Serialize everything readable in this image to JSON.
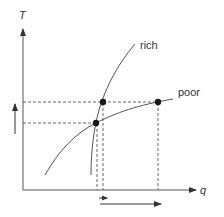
{
  "diagram": {
    "axes": {
      "y_label": "T",
      "x_label": "q"
    },
    "curves": [
      {
        "name": "rich",
        "label": "rich"
      },
      {
        "name": "poor",
        "label": "poor"
      }
    ],
    "points": [
      {
        "name": "lower-intersection",
        "description": "rich and poor curves intersect"
      },
      {
        "name": "upper-rich-point",
        "description": "point on rich curve at raised T"
      },
      {
        "name": "upper-poor-point",
        "description": "point on poor curve at raised T"
      }
    ],
    "annotations": {
      "T_increase_arrow": "up",
      "q_small_shift_arrow": "right",
      "q_large_shift_arrow": "right"
    },
    "colors": {
      "line": "#555555",
      "dashed": "#666666",
      "dot": "#1a1a1a",
      "text": "#333333"
    }
  }
}
